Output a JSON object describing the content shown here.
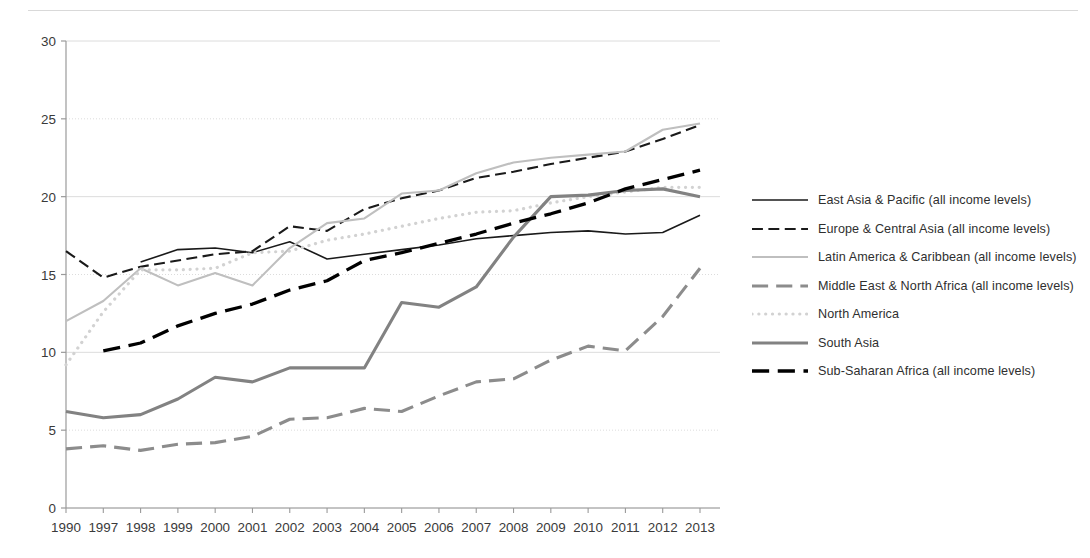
{
  "chart_data": {
    "type": "line",
    "title": "",
    "xlabel": "",
    "ylabel": "",
    "ylim": [
      0,
      30
    ],
    "yticks": [
      0,
      5,
      10,
      15,
      20,
      25,
      30
    ],
    "grid": true,
    "legend_position": "right",
    "categories": [
      "1990",
      "1997",
      "1998",
      "1999",
      "2000",
      "2001",
      "2002",
      "2003",
      "2004",
      "2005",
      "2006",
      "2007",
      "2008",
      "2009",
      "2010",
      "2011",
      "2012",
      "2013"
    ],
    "series": [
      {
        "name": "East Asia & Pacific (all income levels)",
        "style": "solid",
        "color": "#1a1a1a",
        "width": 1.6,
        "values": [
          null,
          null,
          15.8,
          16.6,
          16.7,
          16.4,
          17.1,
          16.0,
          16.3,
          16.6,
          16.9,
          17.3,
          17.5,
          17.7,
          17.8,
          17.6,
          17.7,
          18.8
        ]
      },
      {
        "name": "Europe & Central Asia (all income levels)",
        "style": "dashed",
        "color": "#1a1a1a",
        "width": 2.1,
        "values": [
          16.5,
          14.8,
          15.5,
          15.9,
          16.3,
          16.5,
          18.1,
          17.8,
          19.2,
          19.9,
          20.4,
          21.2,
          21.6,
          22.1,
          22.5,
          22.9,
          23.7,
          24.6
        ]
      },
      {
        "name": "Latin America & Caribbean (all income levels)",
        "style": "solid",
        "color": "#bfbfbf",
        "width": 2.1,
        "values": [
          12.0,
          13.3,
          15.4,
          14.3,
          15.1,
          14.3,
          16.7,
          18.3,
          18.6,
          20.2,
          20.4,
          21.5,
          22.2,
          22.5,
          22.7,
          22.9,
          24.3,
          24.7
        ]
      },
      {
        "name": "Middle East & North Africa (all income levels)",
        "style": "dashed",
        "color": "#8c8c8c",
        "width": 3.1,
        "values": [
          3.8,
          4.0,
          3.7,
          4.1,
          4.2,
          4.6,
          5.7,
          5.8,
          6.4,
          6.2,
          7.2,
          8.1,
          8.3,
          9.5,
          10.4,
          10.1,
          12.3,
          15.4
        ]
      },
      {
        "name": "North America",
        "style": "dotted",
        "color": "#d2d2d2",
        "width": 3.2,
        "values": [
          9.2,
          12.6,
          15.3,
          15.3,
          15.4,
          16.4,
          16.5,
          17.2,
          17.6,
          18.1,
          18.6,
          19.0,
          19.1,
          19.6,
          20.0,
          20.3,
          20.6,
          20.6
        ]
      },
      {
        "name": "South Asia",
        "style": "solid",
        "color": "#828282",
        "width": 3.1,
        "values": [
          6.2,
          5.8,
          6.0,
          7.0,
          8.4,
          8.1,
          9.0,
          9.0,
          9.0,
          13.2,
          12.9,
          14.2,
          17.4,
          20.0,
          20.1,
          20.4,
          20.5,
          20.0
        ]
      },
      {
        "name": "Sub-Saharan Africa (all income levels)",
        "style": "dashed",
        "color": "#000000",
        "width": 3.3,
        "values": [
          null,
          10.1,
          10.6,
          11.7,
          12.5,
          13.1,
          14.0,
          14.6,
          15.9,
          16.4,
          17.0,
          17.6,
          18.3,
          18.9,
          19.6,
          20.5,
          21.1,
          21.7
        ]
      }
    ]
  },
  "legend": {
    "items": [
      {
        "label": "East Asia & Pacific (all income levels)"
      },
      {
        "label": "Europe & Central Asia (all income levels)"
      },
      {
        "label": "Latin America & Caribbean (all income levels)"
      },
      {
        "label": "Middle East & North Africa (all income levels)"
      },
      {
        "label": "North America"
      },
      {
        "label": "South Asia"
      },
      {
        "label": "Sub-Saharan Africa (all income levels)"
      }
    ]
  },
  "colors": {
    "axis": "#9a9a9a",
    "grid": "#dcdcdc",
    "text": "#3a3a3a",
    "background": "#ffffff"
  }
}
